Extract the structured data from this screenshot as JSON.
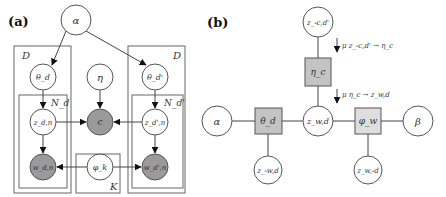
{
  "panel_a": {
    "label": "(a)",
    "plates": {
      "left_docs": "D",
      "left_words": "N_d",
      "right_docs": "D",
      "right_words": "N_d'",
      "topics": "K"
    },
    "nodes": {
      "alpha": "α",
      "theta_d": "θ_d",
      "eta": "η",
      "theta_dprime": "θ_d'",
      "z_dn": "z_d,n",
      "c": "c",
      "z_dprime_n": "z_d',n",
      "w_dn": "w_d,n",
      "phi_k": "φ_k",
      "w_dprime_n": "w_d',n"
    }
  },
  "panel_b": {
    "label": "(b)",
    "nodes": {
      "z_minus_c_dprime": "z_-c,d'",
      "eta_c": "η_c",
      "alpha": "α",
      "theta_d": "θ_d",
      "z_wd": "z_w,d",
      "phi_w": "φ_w",
      "beta": "β",
      "z_minus_w_d": "z_-w,d",
      "z_w_minus_d": "z_w,-d"
    },
    "messages": {
      "msg1": "μ z_-c,d' → η_c",
      "msg2": "μ η_c → z_w,d"
    }
  }
}
